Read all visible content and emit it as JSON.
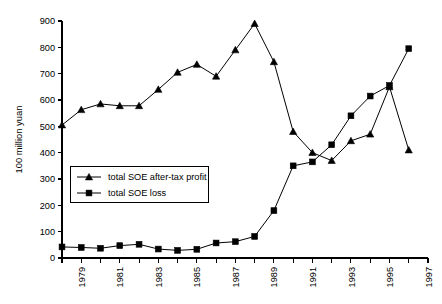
{
  "chart_data": {
    "type": "line",
    "title": "",
    "xlabel": "",
    "ylabel": "100 million yuan",
    "ylim": [
      0,
      900
    ],
    "xlim": [
      1978,
      1997
    ],
    "ytick_step": 100,
    "yticks": [
      0,
      100,
      200,
      300,
      400,
      500,
      600,
      700,
      800,
      900
    ],
    "ytick_labels": [
      "0",
      "100",
      "200",
      "300",
      "400",
      "500",
      "600",
      "700",
      "800",
      "900"
    ],
    "x": [
      1978,
      1979,
      1980,
      1981,
      1982,
      1983,
      1984,
      1985,
      1986,
      1987,
      1988,
      1989,
      1990,
      1991,
      1992,
      1993,
      1994,
      1995,
      1996
    ],
    "xticks": [
      1978,
      1979,
      1980,
      1981,
      1982,
      1983,
      1984,
      1985,
      1986,
      1987,
      1988,
      1989,
      1990,
      1991,
      1992,
      1993,
      1994,
      1995,
      1996,
      1997
    ],
    "xtick_labels_shown": [
      "1979",
      "1981",
      "1983",
      "1985",
      "1987",
      "1989",
      "1991",
      "1993",
      "1995",
      "1997"
    ],
    "xtick_labels_rotated": true,
    "grid": false,
    "legend_position": "center-left",
    "series": [
      {
        "name": "total SOE after-tax profit",
        "marker": "triangle",
        "color": "#000000",
        "values": [
          505,
          563,
          585,
          578,
          578,
          640,
          705,
          735,
          690,
          790,
          890,
          745,
          480,
          400,
          370,
          445,
          470,
          650,
          410
        ]
      },
      {
        "name": "total SOE loss",
        "marker": "square",
        "color": "#000000",
        "values": [
          42,
          40,
          37,
          47,
          52,
          34,
          29,
          33,
          57,
          62,
          82,
          180,
          350,
          365,
          430,
          540,
          615,
          655,
          795
        ]
      }
    ]
  },
  "legend": {
    "items": [
      {
        "label": "total SOE after-tax profit"
      },
      {
        "label": "total SOE loss"
      }
    ]
  },
  "axes": {
    "y_axis_title": "100 million yuan"
  }
}
